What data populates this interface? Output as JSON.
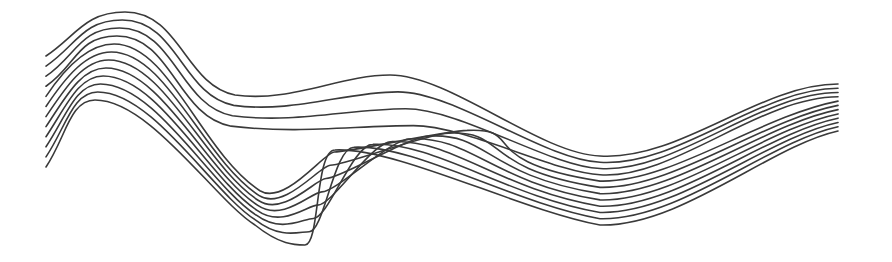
{
  "artwork": {
    "description": "Line-art wave of twelve morphing curves",
    "line_count": 12,
    "stroke_color": "#3a3a3a",
    "stroke_width": 1.6,
    "background": "#ffffff",
    "top_curve": {
      "start": [
        46,
        56
      ],
      "peak": [
        125,
        12
      ],
      "shoulder": [
        230,
        95
      ],
      "bump": [
        390,
        75
      ],
      "converge": [
        600,
        158
      ],
      "end": [
        838,
        84
      ]
    },
    "bottom_curve": {
      "start": [
        46,
        167
      ],
      "peak": [
        95,
        100
      ],
      "trough": [
        305,
        245
      ],
      "cusp_top": [
        335,
        150
      ],
      "converge": [
        600,
        225
      ],
      "end": [
        838,
        131
      ]
    }
  }
}
